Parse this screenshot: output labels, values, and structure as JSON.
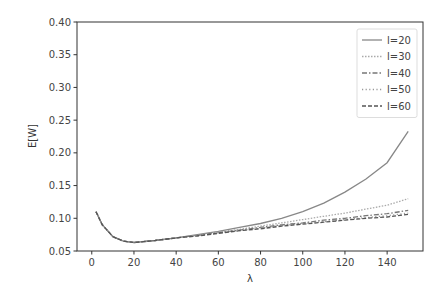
{
  "chart_data": {
    "type": "line",
    "title": "",
    "xlabel": "λ",
    "ylabel": "E[W]",
    "xlim": [
      -7,
      157
    ],
    "ylim": [
      0.05,
      0.4
    ],
    "xticks": [
      0,
      20,
      40,
      60,
      80,
      100,
      120,
      140
    ],
    "yticks": [
      0.05,
      0.1,
      0.15,
      0.2,
      0.25,
      0.3,
      0.35,
      0.4
    ],
    "ytick_labels": [
      "0.05",
      "0.10",
      "0.15",
      "0.20",
      "0.25",
      "0.30",
      "0.35",
      "0.40"
    ],
    "grid": false,
    "legend_position": "upper right",
    "x": [
      2,
      5,
      10,
      15,
      20,
      30,
      40,
      50,
      60,
      70,
      80,
      90,
      100,
      110,
      120,
      130,
      140,
      150
    ],
    "series": [
      {
        "name": "l=20",
        "style": "solid",
        "color": "#888888",
        "values": [
          0.11,
          0.09,
          0.072,
          0.065,
          0.063,
          0.066,
          0.07,
          0.075,
          0.08,
          0.086,
          0.092,
          0.1,
          0.11,
          0.123,
          0.14,
          0.16,
          0.185,
          0.233
        ]
      },
      {
        "name": "l=30",
        "style": "dotted-fine",
        "color": "#aaaaaa",
        "values": [
          0.11,
          0.09,
          0.072,
          0.065,
          0.063,
          0.066,
          0.07,
          0.074,
          0.079,
          0.083,
          0.088,
          0.093,
          0.098,
          0.103,
          0.108,
          0.114,
          0.12,
          0.13
        ]
      },
      {
        "name": "l=40",
        "style": "dashdot",
        "color": "#777777",
        "values": [
          0.11,
          0.09,
          0.072,
          0.065,
          0.063,
          0.066,
          0.07,
          0.074,
          0.078,
          0.082,
          0.086,
          0.09,
          0.093,
          0.097,
          0.1,
          0.104,
          0.107,
          0.112
        ]
      },
      {
        "name": "l=50",
        "style": "dotted",
        "color": "#999999",
        "values": [
          0.11,
          0.09,
          0.072,
          0.065,
          0.063,
          0.066,
          0.07,
          0.074,
          0.078,
          0.081,
          0.085,
          0.089,
          0.092,
          0.095,
          0.098,
          0.101,
          0.104,
          0.108
        ]
      },
      {
        "name": "l=60",
        "style": "dashed",
        "color": "#555555",
        "values": [
          0.11,
          0.09,
          0.072,
          0.065,
          0.063,
          0.066,
          0.07,
          0.073,
          0.077,
          0.081,
          0.084,
          0.088,
          0.091,
          0.094,
          0.097,
          0.1,
          0.102,
          0.106
        ]
      }
    ]
  }
}
